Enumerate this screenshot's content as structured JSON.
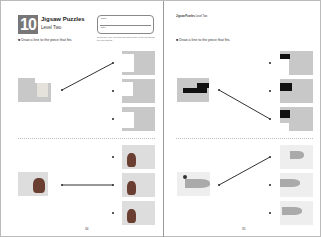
{
  "left_page": {
    "lesson_number": "10",
    "title": "Jigsaw Puzzles",
    "subtitle": "Level Two",
    "name_box": {
      "name_label": "Name",
      "date_label": "Date"
    },
    "note_text": "To parents: Have your child look at the picture on the left and find the piece that fits.",
    "instruction": "■ Draw a line to the piece that fits.",
    "page_number": "34",
    "exercises": [
      {
        "name": "map-puzzle",
        "choices": 3,
        "answer_index": 0
      },
      {
        "name": "bag-puzzle",
        "choices": 3,
        "answer_index": 1
      }
    ]
  },
  "right_page": {
    "header": "Jigsaw Puzzles",
    "header_level": "Level Two",
    "instruction": "■ Draw a line to the piece that fits.",
    "page_number": "35",
    "exercises": [
      {
        "name": "piano-puzzle",
        "choices": 3,
        "answer_index": 2
      },
      {
        "name": "fish-puzzle",
        "choices": 3,
        "answer_index": 0
      }
    ]
  },
  "colors": {
    "piece_gray": "#c8c8c8",
    "line": "#333333",
    "lesson_badge": "#777777"
  }
}
